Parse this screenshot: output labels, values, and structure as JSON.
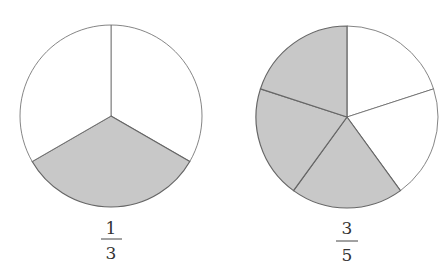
{
  "figures": [
    {
      "name": "one-third-circle",
      "cx": 111,
      "cy": 116,
      "r": 91,
      "slices": 3,
      "shaded": [
        1
      ],
      "fraction": {
        "numerator": "1",
        "denominator": "3"
      }
    },
    {
      "name": "three-fifths-circle",
      "cx": 347,
      "cy": 117,
      "r": 91,
      "slices": 5,
      "shaded": [
        2,
        3,
        4
      ],
      "fraction": {
        "numerator": "3",
        "denominator": "5"
      }
    }
  ],
  "colors": {
    "shade": "#c8c8c8",
    "stroke": "#666666",
    "background": "#ffffff"
  }
}
